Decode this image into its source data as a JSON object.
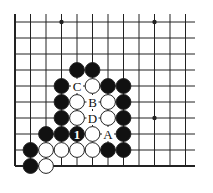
{
  "diagram": {
    "type": "go-board-corner",
    "grid": {
      "cols": 12,
      "rows": 10,
      "x0": 15,
      "dx": 15.5,
      "y0": 22,
      "dy": 16,
      "right_open_edge_x": 195
    },
    "colors": {
      "line": "#222222",
      "black": "#111111",
      "white": "#ffffff",
      "stroke": "#222222"
    },
    "star_points": [
      [
        3,
        0
      ],
      [
        9,
        0
      ],
      [
        9,
        6
      ]
    ],
    "stones": [
      {
        "c": 4,
        "r": 3,
        "color": "black"
      },
      {
        "c": 5,
        "r": 3,
        "color": "black"
      },
      {
        "c": 3,
        "r": 4,
        "color": "black"
      },
      {
        "c": 5,
        "r": 4,
        "color": "white"
      },
      {
        "c": 6,
        "r": 4,
        "color": "black"
      },
      {
        "c": 7,
        "r": 4,
        "color": "black"
      },
      {
        "c": 3,
        "r": 5,
        "color": "black"
      },
      {
        "c": 4,
        "r": 5,
        "color": "white"
      },
      {
        "c": 6,
        "r": 5,
        "color": "white"
      },
      {
        "c": 7,
        "r": 5,
        "color": "black"
      },
      {
        "c": 3,
        "r": 6,
        "color": "black"
      },
      {
        "c": 4,
        "r": 6,
        "color": "white"
      },
      {
        "c": 6,
        "r": 6,
        "color": "white"
      },
      {
        "c": 7,
        "r": 6,
        "color": "black"
      },
      {
        "c": 2,
        "r": 7,
        "color": "black"
      },
      {
        "c": 3,
        "r": 7,
        "color": "black"
      },
      {
        "c": 4,
        "r": 7,
        "color": "black",
        "label": "1"
      },
      {
        "c": 5,
        "r": 7,
        "color": "white"
      },
      {
        "c": 7,
        "r": 7,
        "color": "black"
      },
      {
        "c": 1,
        "r": 8,
        "color": "black"
      },
      {
        "c": 2,
        "r": 8,
        "color": "white"
      },
      {
        "c": 3,
        "r": 8,
        "color": "white"
      },
      {
        "c": 4,
        "r": 8,
        "color": "white"
      },
      {
        "c": 5,
        "r": 8,
        "color": "white"
      },
      {
        "c": 6,
        "r": 8,
        "color": "black"
      },
      {
        "c": 7,
        "r": 8,
        "color": "black"
      },
      {
        "c": 1,
        "r": 9,
        "color": "black"
      },
      {
        "c": 2,
        "r": 9,
        "color": "white"
      }
    ],
    "point_labels": [
      {
        "c": 4,
        "r": 4,
        "text": "C"
      },
      {
        "c": 5,
        "r": 5,
        "text": "B"
      },
      {
        "c": 5,
        "r": 6,
        "text": "D"
      },
      {
        "c": 6,
        "r": 7,
        "text": "A"
      }
    ]
  }
}
